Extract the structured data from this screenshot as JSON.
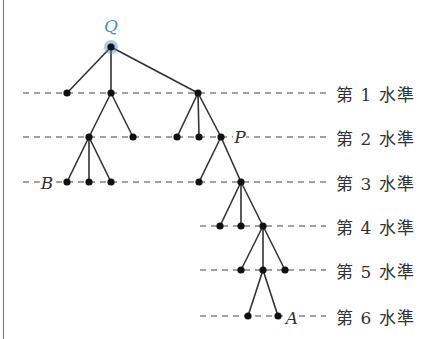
{
  "diagram": {
    "type": "tree",
    "root": {
      "label": "Q",
      "x": 111,
      "y": 47,
      "highlight_color": "#4a8fd0"
    },
    "levels": [
      {
        "label": "第 1 水準",
        "y": 93,
        "line_start": 23
      },
      {
        "label": "第 2 水準",
        "y": 137,
        "line_start": 23
      },
      {
        "label": "第 3 水準",
        "y": 182,
        "line_start": 23
      },
      {
        "label": "第 4 水準",
        "y": 226,
        "line_start": 200
      },
      {
        "label": "第 5 水準",
        "y": 270,
        "line_start": 200
      },
      {
        "label": "第 6 水準",
        "y": 316,
        "line_start": 200
      }
    ],
    "line_end": 326,
    "nodes": [
      {
        "id": "Q",
        "x": 111,
        "y": 47
      },
      {
        "id": "a1",
        "x": 67,
        "y": 93,
        "parent": "Q"
      },
      {
        "id": "a2",
        "x": 111,
        "y": 93,
        "parent": "Q"
      },
      {
        "id": "a3",
        "x": 198,
        "y": 93,
        "parent": "Q"
      },
      {
        "id": "b1",
        "x": 89,
        "y": 137,
        "parent": "a2"
      },
      {
        "id": "b2",
        "x": 133,
        "y": 137,
        "parent": "a2"
      },
      {
        "id": "b3",
        "x": 177,
        "y": 137,
        "parent": "a3"
      },
      {
        "id": "b4",
        "x": 199,
        "y": 137,
        "parent": "a3"
      },
      {
        "id": "P",
        "x": 221,
        "y": 137,
        "parent": "a3"
      },
      {
        "id": "B",
        "x": 67,
        "y": 182,
        "parent": "b1"
      },
      {
        "id": "c2",
        "x": 89,
        "y": 182,
        "parent": "b1"
      },
      {
        "id": "c3",
        "x": 111,
        "y": 182,
        "parent": "b1"
      },
      {
        "id": "c4",
        "x": 199,
        "y": 182,
        "parent": "P"
      },
      {
        "id": "c5",
        "x": 241,
        "y": 182,
        "parent": "P"
      },
      {
        "id": "d1",
        "x": 220,
        "y": 226,
        "parent": "c5"
      },
      {
        "id": "d2",
        "x": 241,
        "y": 226,
        "parent": "c5"
      },
      {
        "id": "d3",
        "x": 263,
        "y": 226,
        "parent": "c5"
      },
      {
        "id": "e1",
        "x": 241,
        "y": 270,
        "parent": "d3"
      },
      {
        "id": "e2",
        "x": 263,
        "y": 270,
        "parent": "d3"
      },
      {
        "id": "e3",
        "x": 285,
        "y": 270,
        "parent": "d3"
      },
      {
        "id": "f1",
        "x": 248,
        "y": 316,
        "parent": "e2"
      },
      {
        "id": "A",
        "x": 278,
        "y": 316,
        "parent": "e2"
      }
    ],
    "node_labels": [
      {
        "text": "Q",
        "x": 111,
        "y": 26,
        "root": true
      },
      {
        "text": "P",
        "x": 240,
        "y": 137
      },
      {
        "text": "B",
        "x": 47,
        "y": 183
      },
      {
        "text": "A",
        "x": 292,
        "y": 318
      }
    ]
  }
}
